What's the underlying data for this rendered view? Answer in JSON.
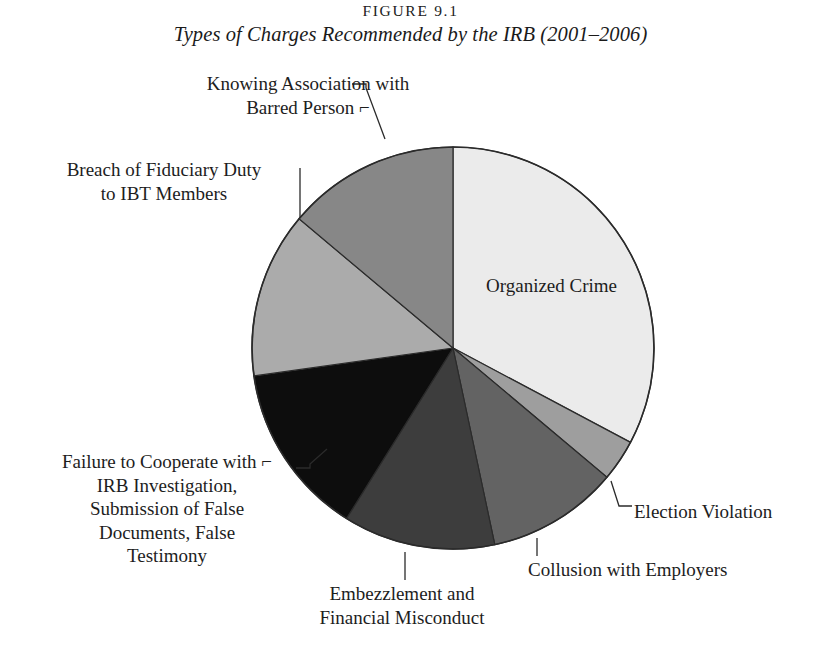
{
  "figure": {
    "number": "FIGURE 9.1",
    "title": "Types of Charges Recommended by the IRB (2001–2006)"
  },
  "chart_data": {
    "type": "pie",
    "title": "Types of Charges Recommended by the IRB (2001–2006)",
    "subtitle": "FIGURE 9.1",
    "legend_position": "callout-labels",
    "grid": false,
    "start_angle_deg": 0,
    "direction": "clockwise",
    "categories": [
      "Organized Crime",
      "Election Violation",
      "Collusion with Employers",
      "Embezzlement and Financial Misconduct",
      "Failure to Cooperate with IRB Investigation, Submission of False Documents, False Testimony",
      "Breach of Fiduciary Duty to IBT Members",
      "Knowing Association with Barred Person"
    ],
    "values": [
      32.8,
      3.3,
      10.6,
      12.2,
      13.9,
      13.3,
      13.9
    ],
    "units": "percent",
    "colors": [
      "#ebebeb",
      "#9e9e9e",
      "#636363",
      "#3d3d3d",
      "#0d0d0d",
      "#ababab",
      "#878787"
    ],
    "slices": [
      {
        "label": "Organized Crime",
        "value": 32.8,
        "start_deg": 0,
        "end_deg": 118,
        "color": "#ebebeb"
      },
      {
        "label": "Election Violation",
        "value": 3.3,
        "start_deg": 118,
        "end_deg": 130,
        "color": "#9e9e9e"
      },
      {
        "label": "Collusion with Employers",
        "value": 10.6,
        "start_deg": 130,
        "end_deg": 168,
        "color": "#636363"
      },
      {
        "label": "Embezzlement and Financial Misconduct",
        "value": 12.2,
        "start_deg": 168,
        "end_deg": 212,
        "color": "#3d3d3d"
      },
      {
        "label": "Failure to Cooperate with IRB Investigation, Submission of False Documents, False Testimony",
        "value": 13.9,
        "start_deg": 212,
        "end_deg": 262,
        "color": "#0d0d0d"
      },
      {
        "label": "Breach of Fiduciary Duty to IBT Members",
        "value": 13.3,
        "start_deg": 262,
        "end_deg": 310,
        "color": "#ababab"
      },
      {
        "label": "Knowing Association with Barred Person",
        "value": 13.9,
        "start_deg": 310,
        "end_deg": 360,
        "color": "#878787"
      }
    ]
  },
  "labels": {
    "organized_crime": "Organized Crime",
    "knowing_association": "Knowing Association with\nBarred Person ⌐",
    "breach_fiduciary": "Breach of Fiduciary Duty\nto IBT Members",
    "failure_cooperate": "Failure to Cooperate with ⌐\nIRB Investigation,\nSubmission of False\nDocuments, False\nTestimony",
    "embezzlement": "Embezzlement and\nFinancial Misconduct",
    "collusion": "Collusion with Employers",
    "election_violation": "Election Violation"
  },
  "style": {
    "background": "#ffffff",
    "outline": "#2b2b2b",
    "text": "#1d1d1d"
  }
}
